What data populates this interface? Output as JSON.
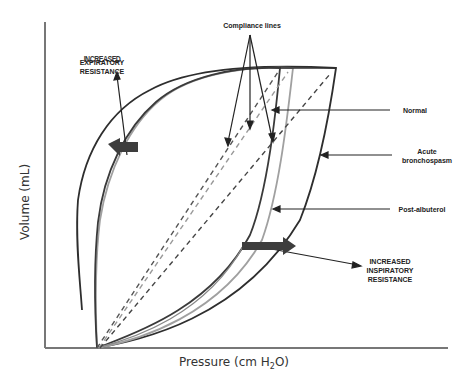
{
  "diagram": {
    "type": "pressure-volume loop",
    "axes": {
      "x_label": "Pressure (cm H",
      "x_label_sub": "2",
      "x_label_end": "O)",
      "y_label": "Volume (mL)"
    },
    "annotations": {
      "compliance_lines": "Compliance lines",
      "normal": "Normal",
      "acute_line1": "Acute",
      "acute_line2": "bronchospasm",
      "post_albuterol": "Post-albuterol",
      "expiratory_line1": "EXPIRATORY",
      "expiratory_line2": "RESISTANCE",
      "expiratory_garbled": "INCREASED",
      "inspiratory_line1": "INCREASED",
      "inspiratory_line2": "INSPIRATORY",
      "inspiratory_line3": "RESISTANCE"
    },
    "loops": [
      {
        "name": "Normal",
        "color": "#3a3a3a"
      },
      {
        "name": "Post-albuterol",
        "color": "#9a9a9a"
      },
      {
        "name": "Acute bronchospasm",
        "color": "#2e2e2e"
      }
    ],
    "colors": {
      "axis": "#666666",
      "dark_line": "#333333",
      "light_line": "#999999",
      "arrow_fill": "#444444"
    }
  }
}
